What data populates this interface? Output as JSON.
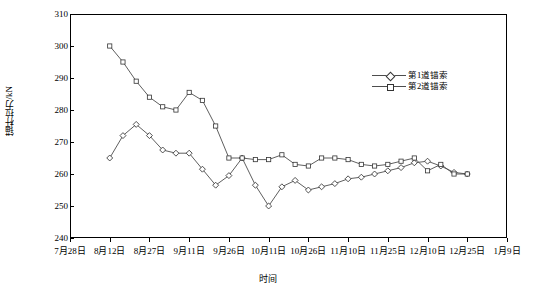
{
  "chart_data": {
    "type": "line",
    "title": "",
    "xlabel": "时间",
    "ylabel": "锚杆拉力/kN",
    "ylim": [
      240,
      310
    ],
    "yticks": [
      240,
      250,
      260,
      270,
      280,
      290,
      300,
      310
    ],
    "xticks": [
      "7月28日",
      "8月12日",
      "8月27日",
      "9月11日",
      "9月26日",
      "10月11日",
      "10月26日",
      "11月10日",
      "11月25日",
      "12月10日",
      "12月25日",
      "1月9日"
    ],
    "grid": false,
    "legend_position": "right-top",
    "series": [
      {
        "name": "第1道锚索",
        "marker": "diamond",
        "x": [
          "8月12日",
          "8月17日",
          "8月22日",
          "8月27日",
          "9月1日",
          "9月6日",
          "9月11日",
          "9月16日",
          "9月21日",
          "9月26日",
          "10月1日",
          "10月6日",
          "10月11日",
          "10月16日",
          "10月21日",
          "10月26日",
          "10月31日",
          "11月5日",
          "11月10日",
          "11月15日",
          "11月20日",
          "11月25日",
          "11月30日",
          "12月5日",
          "12月10日",
          "12月15日",
          "12月20日",
          "12月25日"
        ],
        "values": [
          265,
          272,
          275.5,
          272,
          267.5,
          266.5,
          266.5,
          261.5,
          256.5,
          259.5,
          265,
          256.5,
          250,
          256,
          258,
          255,
          256,
          257,
          258.5,
          259,
          260,
          261,
          262,
          263.5,
          264,
          262.5,
          260.5,
          260
        ]
      },
      {
        "name": "第2道锚索",
        "marker": "square",
        "x": [
          "8月12日",
          "8月17日",
          "8月22日",
          "8月27日",
          "9月1日",
          "9月6日",
          "9月11日",
          "9月16日",
          "9月21日",
          "9月26日",
          "10月1日",
          "10月6日",
          "10月11日",
          "10月16日",
          "10月21日",
          "10月26日",
          "10月31日",
          "11月5日",
          "11月10日",
          "11月15日",
          "11月20日",
          "11月25日",
          "11月30日",
          "12月5日",
          "12月10日",
          "12月15日",
          "12月20日",
          "12月25日"
        ],
        "values": [
          300,
          295,
          289,
          284,
          281,
          280,
          285.5,
          283,
          275,
          265,
          265,
          264.5,
          264.5,
          266,
          263,
          262.5,
          265,
          265,
          264.5,
          263,
          262.5,
          263,
          264,
          265,
          261,
          263,
          260,
          260
        ]
      }
    ],
    "legend_entries": [
      "第1道锚索",
      "第2道锚索"
    ]
  }
}
